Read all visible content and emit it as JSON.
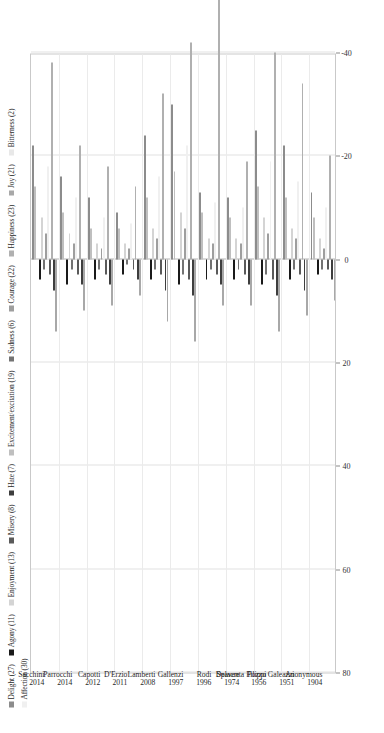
{
  "chart_data": {
    "type": "bar",
    "orientation": "horizontal",
    "title": "",
    "subtitle": "",
    "xlabel": "",
    "ylabel": "",
    "xlim": [
      -40,
      80
    ],
    "xticks": [
      80,
      60,
      40,
      20,
      0,
      -20,
      -40
    ],
    "xticklabels": [
      "80",
      "60",
      "40",
      "20",
      "0",
      "-20",
      "-40"
    ],
    "grid": true,
    "grid_axis": "x",
    "legend_position": "top-left",
    "categories": [
      "Sacchini\n2014",
      "Parrocchi\n2014",
      "Capotti\n2012",
      "D'Erzio\n2011",
      "Lamberti\n2008",
      "Gallenzi\n1997",
      "Rodi\n1996",
      "Delacre\n1974",
      "Spaventa Filippi\n1956",
      "Pozzo Galeazzi\n1951",
      "Anonymous\n1904"
    ],
    "category_names": [
      {
        "name": "Sacchini",
        "year": "2014"
      },
      {
        "name": "Parrocchi",
        "year": "2014"
      },
      {
        "name": "Capotti",
        "year": "2012"
      },
      {
        "name": "D'Erzio",
        "year": "2011"
      },
      {
        "name": "Lamberti",
        "year": "2008"
      },
      {
        "name": "Gallenzi",
        "year": "1997"
      },
      {
        "name": "Rodi",
        "year": "1996"
      },
      {
        "name": "Delacre",
        "year": "1974"
      },
      {
        "name": "Spaventa Filippi",
        "year": "1956"
      },
      {
        "name": "Pozzo Galeazzi",
        "year": "1951"
      },
      {
        "name": "Anonymous",
        "year": "1904"
      }
    ],
    "series": [
      {
        "name": "Delight (27)",
        "color": "#8c8c8c",
        "values": [
          -22,
          -16,
          -12,
          -9,
          -24,
          -30,
          -13,
          -12,
          -25,
          -22,
          -13
        ]
      },
      {
        "name": "Excitement/excitation (19)",
        "color": "#bfbfbf",
        "values": [
          -14,
          -9,
          -6,
          -6,
          -12,
          -17,
          -9,
          -8,
          -14,
          -12,
          -8
        ]
      },
      {
        "name": "Bitterness (2)",
        "color": "#e8e8e8",
        "values": [
          0,
          0,
          0,
          0,
          0,
          0,
          0,
          0,
          0,
          0,
          0
        ]
      },
      {
        "name": "Agony (11)",
        "color": "#1a1a1a",
        "values": [
          4,
          5,
          4,
          3,
          4,
          5,
          4,
          4,
          5,
          4,
          3
        ]
      },
      {
        "name": "Enjoyment (13)",
        "color": "#d4d4d4",
        "values": [
          -8,
          -5,
          -3,
          -3,
          -6,
          -9,
          -4,
          -4,
          -8,
          -6,
          -4
        ]
      },
      {
        "name": "Sadness (6)",
        "color": "#737373",
        "values": [
          2,
          2,
          2,
          1,
          2,
          3,
          2,
          2,
          3,
          2,
          2
        ]
      },
      {
        "name": "Courage (22)",
        "color": "#9e9e9e",
        "values": [
          -5,
          -3,
          -2,
          -2,
          -4,
          -6,
          -3,
          -3,
          -5,
          -4,
          -2
        ]
      },
      {
        "name": "Affection (30)",
        "color": "#f0f0f0",
        "values": [
          -18,
          -12,
          -8,
          -7,
          -16,
          -22,
          -11,
          -10,
          -19,
          -15,
          -10
        ]
      },
      {
        "name": "Misery (8)",
        "color": "#5a5a5a",
        "values": [
          3,
          3,
          3,
          2,
          3,
          4,
          3,
          3,
          4,
          3,
          2
        ]
      },
      {
        "name": "Happiness (23)",
        "color": "#b0b0b0",
        "values": [
          -38,
          -22,
          -18,
          -14,
          -32,
          -42,
          -62,
          -19,
          -40,
          -34,
          -20
        ]
      },
      {
        "name": "Hate (7)",
        "color": "#3d3d3d",
        "values": [
          6,
          5,
          5,
          4,
          6,
          7,
          5,
          5,
          7,
          6,
          4
        ]
      },
      {
        "name": "Joy (21)",
        "color": "#a8a8a8",
        "values": [
          14,
          10,
          9,
          7,
          12,
          16,
          9,
          9,
          14,
          11,
          8
        ]
      }
    ]
  },
  "legend": {
    "items": [
      {
        "label": "Delight (27)",
        "color": "#8c8c8c"
      },
      {
        "label": "Agony (11)",
        "color": "#1a1a1a"
      },
      {
        "label": "Enjoyment (13)",
        "color": "#d4d4d4"
      },
      {
        "label": "Misery (8)",
        "color": "#5a5a5a"
      },
      {
        "label": "Hate (7)",
        "color": "#3d3d3d"
      },
      {
        "label": "Excitement/excitation (19)",
        "color": "#bfbfbf"
      },
      {
        "label": "Sadness (6)",
        "color": "#737373"
      },
      {
        "label": "Courage (22)",
        "color": "#9e9e9e"
      },
      {
        "label": "Happiness (23)",
        "color": "#b0b0b0"
      },
      {
        "label": "Joy (21)",
        "color": "#a8a8a8"
      },
      {
        "label": "Bitterness (2)",
        "color": "#e8e8e8"
      },
      {
        "label": "Affection (30)",
        "color": "#f0f0f0"
      }
    ]
  },
  "colors": {
    "grid": "#e2e2e2",
    "axis": "#c9c9c9",
    "zero": "#b5b5b5",
    "background": "#ffffff",
    "text": "#1f1f1f"
  }
}
